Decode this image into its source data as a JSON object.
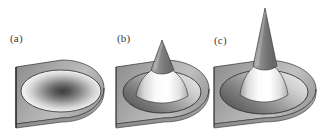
{
  "figure": {
    "background_color": "#ffffff",
    "panel_count": 3,
    "rendering": "grayscale 3d shaded surface",
    "width": 331,
    "height": 137
  },
  "panels": [
    {
      "id": "a",
      "label": "(a)",
      "description": "flat plate with shallow elliptical dimple, white ring with dark radial center",
      "cone_height": 0,
      "feature": "dimple",
      "plate_fill_dark": "#8e8e8e",
      "plate_fill_light": "#c9c9c9",
      "dimple_center_color": "#4a4a4a",
      "dimple_rim_color": "#ffffff"
    },
    {
      "id": "b",
      "label": "(b)",
      "description": "short cone rising from elliptical depression in plate",
      "cone_height": 38,
      "feature": "short-cone",
      "plate_fill_dark": "#8e8e8e",
      "plate_fill_light": "#c9c9c9",
      "cone_shadow_color": "#767676",
      "cone_highlight_color": "#fdfdfd"
    },
    {
      "id": "c",
      "label": "(c)",
      "description": "tall sharp cone rising from elliptical depression in plate",
      "cone_height": 72,
      "feature": "tall-cone",
      "plate_fill_dark": "#8e8e8e",
      "plate_fill_light": "#c9c9c9",
      "cone_shadow_color": "#6f6f6f",
      "cone_highlight_color": "#fdfdfd"
    }
  ],
  "colors": {
    "background": "#ffffff",
    "outline": "#2a2a2a",
    "label_text": "#3a3a3a",
    "plate_mid": "#a8a8a8",
    "depression_dark": "#6b6b6b",
    "depression_light": "#e8e8e8"
  }
}
